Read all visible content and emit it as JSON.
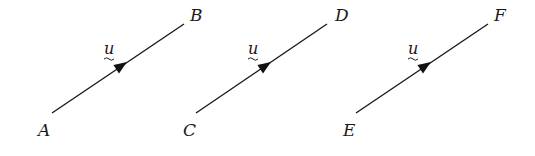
{
  "diagram": {
    "vectors": [
      {
        "start_label": "A",
        "end_label": "B",
        "vector_label": "u"
      },
      {
        "start_label": "C",
        "end_label": "D",
        "vector_label": "u"
      },
      {
        "start_label": "E",
        "end_label": "F",
        "vector_label": "u"
      }
    ]
  }
}
